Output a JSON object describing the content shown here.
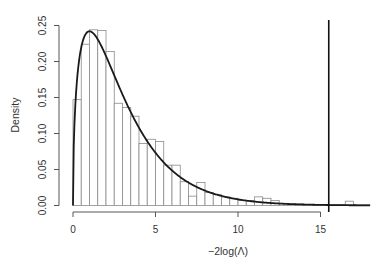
{
  "chart_data": {
    "type": "bar",
    "subtype": "histogram-with-density-curve",
    "title": "",
    "xlabel": "−2log(Λ)",
    "ylabel": "Density",
    "xlim": [
      0,
      18
    ],
    "ylim": [
      0,
      0.25
    ],
    "x_ticks": [
      0,
      5,
      10,
      15
    ],
    "x_tick_labels": [
      "0",
      "5",
      "10",
      "15"
    ],
    "y_ticks": [
      0.0,
      0.05,
      0.1,
      0.15,
      0.2,
      0.25
    ],
    "y_tick_labels": [
      "0.00",
      "0.05",
      "0.10",
      "0.15",
      "0.20",
      "0.25"
    ],
    "grid": false,
    "legend": null,
    "bin_width": 0.5,
    "bins": [
      {
        "start": 0.0,
        "end": 0.5,
        "density": 0.147
      },
      {
        "start": 0.5,
        "end": 1.0,
        "density": 0.224
      },
      {
        "start": 1.0,
        "end": 1.5,
        "density": 0.244
      },
      {
        "start": 1.5,
        "end": 2.0,
        "density": 0.243
      },
      {
        "start": 2.0,
        "end": 2.5,
        "density": 0.214
      },
      {
        "start": 2.5,
        "end": 3.0,
        "density": 0.142
      },
      {
        "start": 3.0,
        "end": 3.5,
        "density": 0.136
      },
      {
        "start": 3.5,
        "end": 4.0,
        "density": 0.124
      },
      {
        "start": 4.0,
        "end": 4.5,
        "density": 0.086
      },
      {
        "start": 4.5,
        "end": 5.0,
        "density": 0.092
      },
      {
        "start": 5.0,
        "end": 5.5,
        "density": 0.089
      },
      {
        "start": 5.5,
        "end": 6.0,
        "density": 0.056
      },
      {
        "start": 6.0,
        "end": 6.5,
        "density": 0.056
      },
      {
        "start": 6.5,
        "end": 7.0,
        "density": 0.033
      },
      {
        "start": 7.0,
        "end": 7.5,
        "density": 0.013
      },
      {
        "start": 7.5,
        "end": 8.0,
        "density": 0.032
      },
      {
        "start": 8.0,
        "end": 8.5,
        "density": 0.018
      },
      {
        "start": 8.5,
        "end": 9.0,
        "density": 0.015
      },
      {
        "start": 9.0,
        "end": 9.5,
        "density": 0.012
      },
      {
        "start": 9.5,
        "end": 10.0,
        "density": 0.01
      },
      {
        "start": 10.0,
        "end": 10.5,
        "density": 0.007
      },
      {
        "start": 10.5,
        "end": 11.0,
        "density": 0.007
      },
      {
        "start": 11.0,
        "end": 11.5,
        "density": 0.012
      },
      {
        "start": 11.5,
        "end": 12.0,
        "density": 0.01
      },
      {
        "start": 12.0,
        "end": 12.5,
        "density": 0.007
      },
      {
        "start": 12.5,
        "end": 13.0,
        "density": 0.003
      },
      {
        "start": 13.0,
        "end": 13.5,
        "density": 0.002
      },
      {
        "start": 13.5,
        "end": 14.0,
        "density": 0.002
      },
      {
        "start": 14.0,
        "end": 14.5,
        "density": 0.001
      },
      {
        "start": 14.5,
        "end": 15.0,
        "density": 0.001
      },
      {
        "start": 15.0,
        "end": 15.5,
        "density": 0.001
      },
      {
        "start": 15.5,
        "end": 16.0,
        "density": 0.001
      },
      {
        "start": 16.0,
        "end": 16.5,
        "density": 0.001
      },
      {
        "start": 16.5,
        "end": 17.0,
        "density": 0.006
      },
      {
        "start": 17.0,
        "end": 17.5,
        "density": 0.001
      },
      {
        "start": 17.5,
        "end": 18.0,
        "density": 0.001
      }
    ],
    "density_curve": {
      "name": "chi-square density (df = 3)",
      "df": 3,
      "x_range": [
        0,
        18
      ]
    },
    "vertical_line": {
      "x": 15.5,
      "label": ""
    }
  },
  "colors": {
    "bar_fill": "#ffffff",
    "bar_stroke": "#8a8a8a",
    "curve": "#1a1a1a",
    "axis": "#444444",
    "vline": "#111111"
  }
}
